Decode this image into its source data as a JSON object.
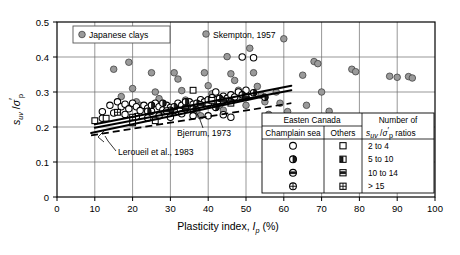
{
  "chart_data": {
    "type": "scatter",
    "title": "",
    "xlabel": "Plasticity index, Ip (%)",
    "ylabel": "suv / σ'p",
    "xlim": [
      0,
      100
    ],
    "ylim": [
      0,
      0.5
    ],
    "xticks": [
      "0",
      "10",
      "20",
      "30",
      "40",
      "50",
      "60",
      "70",
      "80",
      "90",
      "100"
    ],
    "yticks": [
      "0",
      "0.1",
      "0.2",
      "0.3",
      "0.4",
      "0.5"
    ],
    "grid": true,
    "legend_position": "inside-bottom-right",
    "annotations": [
      {
        "id": "japanese-clays",
        "text": "Japanese clays",
        "x": 22,
        "y": 0.455
      },
      {
        "id": "skempton",
        "text": "Skempton, 1957",
        "x": 47,
        "y": 0.435
      },
      {
        "id": "bjerrum",
        "text": "Bjerrum, 1973",
        "x": 40,
        "y": 0.192
      },
      {
        "id": "leroueil",
        "text": "Leroueil et al., 1983",
        "x": 30,
        "y": 0.155
      }
    ],
    "series": [
      {
        "name": "Japanese clays",
        "marker": "filled-gray-circle",
        "color": "#9a9a9a",
        "points": [
          [
            15,
            0.365
          ],
          [
            17,
            0.287
          ],
          [
            19,
            0.385
          ],
          [
            20,
            0.31
          ],
          [
            21,
            0.272
          ],
          [
            22,
            0.262
          ],
          [
            25,
            0.355
          ],
          [
            26,
            0.3
          ],
          [
            27,
            0.281
          ],
          [
            28,
            0.265
          ],
          [
            29,
            0.252
          ],
          [
            30,
            0.24
          ],
          [
            31,
            0.355
          ],
          [
            32,
            0.337
          ],
          [
            33,
            0.304
          ],
          [
            34,
            0.277
          ],
          [
            35,
            0.268
          ],
          [
            36,
            0.258
          ],
          [
            37,
            0.243
          ],
          [
            38,
            0.232
          ],
          [
            39,
            0.355
          ],
          [
            40,
            0.318
          ],
          [
            41,
            0.295
          ],
          [
            42,
            0.274
          ],
          [
            43,
            0.262
          ],
          [
            44,
            0.248
          ],
          [
            45,
            0.401
          ],
          [
            46,
            0.352
          ],
          [
            47,
            0.333
          ],
          [
            48,
            0.305
          ],
          [
            49,
            0.284
          ],
          [
            50,
            0.262
          ],
          [
            51,
            0.425
          ],
          [
            52,
            0.355
          ],
          [
            53,
            0.316
          ],
          [
            54,
            0.291
          ],
          [
            55,
            0.272
          ],
          [
            56,
            0.236
          ],
          [
            57,
            0.214
          ],
          [
            58,
            0.3
          ],
          [
            59,
            0.268
          ],
          [
            60,
            0.452
          ],
          [
            61,
            0.244
          ],
          [
            62,
            0.228
          ],
          [
            63,
            0.218
          ],
          [
            64,
            0.206
          ],
          [
            65,
            0.348
          ],
          [
            66,
            0.262
          ],
          [
            68,
            0.387
          ],
          [
            69,
            0.381
          ],
          [
            70,
            0.3
          ],
          [
            72,
            0.245
          ],
          [
            75,
            0.205
          ],
          [
            78,
            0.365
          ],
          [
            79,
            0.358
          ],
          [
            80,
            0.155
          ],
          [
            88,
            0.345
          ],
          [
            90,
            0.342
          ],
          [
            93,
            0.344
          ],
          [
            94,
            0.34
          ]
        ]
      },
      {
        "name": "Champlain sea, 2 to 4 ratios",
        "marker": "open-circle",
        "points": [
          [
            12,
            0.225
          ],
          [
            14,
            0.262
          ],
          [
            16,
            0.272
          ],
          [
            17,
            0.258
          ],
          [
            18,
            0.265
          ],
          [
            19,
            0.252
          ],
          [
            20,
            0.268
          ],
          [
            21,
            0.258
          ],
          [
            22,
            0.247
          ],
          [
            23,
            0.262
          ],
          [
            24,
            0.254
          ],
          [
            25,
            0.245
          ],
          [
            26,
            0.268
          ],
          [
            27,
            0.258
          ],
          [
            28,
            0.249
          ],
          [
            29,
            0.262
          ],
          [
            30,
            0.256
          ],
          [
            31,
            0.247
          ],
          [
            32,
            0.268
          ],
          [
            33,
            0.262
          ],
          [
            34,
            0.255
          ],
          [
            35,
            0.272
          ],
          [
            36,
            0.265
          ],
          [
            37,
            0.258
          ],
          [
            38,
            0.278
          ],
          [
            39,
            0.272
          ],
          [
            40,
            0.265
          ],
          [
            41,
            0.284
          ],
          [
            42,
            0.278
          ],
          [
            43,
            0.272
          ],
          [
            44,
            0.288
          ],
          [
            45,
            0.282
          ],
          [
            46,
            0.292
          ],
          [
            47,
            0.286
          ],
          [
            48,
            0.3
          ],
          [
            49,
            0.4
          ],
          [
            50,
            0.305
          ],
          [
            52,
            0.398
          ],
          [
            42,
            0.3
          ],
          [
            46,
            0.228
          ],
          [
            44,
            0.235
          ],
          [
            40,
            0.232
          ],
          [
            36,
            0.232
          ],
          [
            33,
            0.238
          ],
          [
            30,
            0.228
          ],
          [
            27,
            0.232
          ],
          [
            24,
            0.226
          ],
          [
            21,
            0.23
          ],
          [
            18,
            0.236
          ],
          [
            15,
            0.24
          ],
          [
            12,
            0.244
          ]
        ]
      },
      {
        "name": "Champlain sea, 5 to 10 ratios",
        "marker": "half-filled-circle",
        "points": [
          [
            25,
            0.262
          ],
          [
            28,
            0.268
          ],
          [
            31,
            0.258
          ],
          [
            34,
            0.272
          ],
          [
            37,
            0.268
          ],
          [
            40,
            0.278
          ],
          [
            43,
            0.282
          ],
          [
            46,
            0.272
          ],
          [
            49,
            0.292
          ],
          [
            52,
            0.298
          ],
          [
            55,
            0.285
          ],
          [
            24,
            0.245
          ],
          [
            30,
            0.248
          ],
          [
            36,
            0.252
          ],
          [
            42,
            0.256
          ]
        ]
      },
      {
        "name": "Champlain sea, 10 to 14 ratios",
        "marker": "band-circle",
        "points": [
          [
            38,
            0.264
          ],
          [
            44,
            0.275
          ],
          [
            50,
            0.285
          ],
          [
            34,
            0.252
          ],
          [
            29,
            0.246
          ]
        ]
      },
      {
        "name": "Others, 2 to 4 ratios",
        "marker": "open-square",
        "points": [
          [
            10,
            0.218
          ],
          [
            13,
            0.225
          ],
          [
            36,
            0.305
          ],
          [
            41,
            0.276
          ],
          [
            46,
            0.268
          ],
          [
            26,
            0.218
          ],
          [
            20,
            0.212
          ]
        ]
      },
      {
        "name": "Others, > 15 ratios",
        "marker": "grid-square",
        "points": [
          [
            16,
            0.242
          ],
          [
            20,
            0.228
          ]
        ]
      }
    ],
    "trendlines": [
      {
        "id": "trend-upper",
        "style": "solid",
        "x1": 10,
        "y1": 0.208,
        "x2": 62,
        "y2": 0.318
      },
      {
        "id": "trend-mid",
        "style": "solid",
        "x1": 10,
        "y1": 0.198,
        "x2": 62,
        "y2": 0.305
      },
      {
        "id": "trend-lower",
        "style": "solid",
        "x1": 9,
        "y1": 0.183,
        "x2": 55,
        "y2": 0.288
      },
      {
        "id": "trend-dashed",
        "style": "dashed",
        "x1": 9,
        "y1": 0.176,
        "x2": 62,
        "y2": 0.268
      }
    ],
    "legend": {
      "header_group": "Easten Canada",
      "col_champlain": "Champlain sea",
      "col_others": "Others",
      "col_ratio_label": "suv /σ'p ratios",
      "col_ratio_prefix": "Number of",
      "rows": [
        {
          "champlain_marker": "open-circle",
          "others_marker": "open-square",
          "ratio": "2 to 4"
        },
        {
          "champlain_marker": "half-filled-circle",
          "others_marker": "half-filled-square",
          "ratio": "5 to 10"
        },
        {
          "champlain_marker": "band-circle",
          "others_marker": "band-square",
          "ratio": "10 to 14"
        },
        {
          "champlain_marker": "cross-circle",
          "others_marker": "grid-square",
          "ratio": "> 15"
        }
      ]
    }
  }
}
